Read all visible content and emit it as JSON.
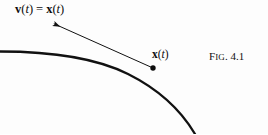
{
  "figure": {
    "caption": "Fig. 4.1",
    "caption_prefix": "F",
    "caption_smallcaps": "IG",
    "caption_rest": ". 4.1",
    "background_color": "#fdfdfd",
    "ink_color": "#0d0d0d"
  },
  "labels": {
    "velocity": {
      "vector_symbol": "v",
      "arg_open": "(",
      "arg_var": "t",
      "arg_close": ")",
      "equals": "=",
      "derivative_symbol": "x",
      "derivative_dot": "˙",
      "plain_text": "v(t) = ẋ(t)"
    },
    "position": {
      "vector_symbol": "x",
      "arg_open": "(",
      "arg_var": "t",
      "arg_close": ")",
      "plain_text": "x(t)"
    }
  },
  "geometry": {
    "curve": {
      "name": "trajectory-curve",
      "path": "M 0 51.5 C 48 51.5 96 58 128 74 C 160 90 182 112 195 134",
      "stroke_width": 2.3,
      "color": "#111111"
    },
    "tangent_arrow": {
      "name": "velocity-vector-arrow",
      "from_x": 153,
      "from_y": 68,
      "to_x": 50,
      "to_y": 22,
      "stroke_width": 1.0,
      "color": "#111111"
    },
    "point_marker": {
      "name": "tangency-point",
      "cx": 153,
      "cy": 68,
      "r": 2.7,
      "color": "#0d0d0d"
    }
  }
}
